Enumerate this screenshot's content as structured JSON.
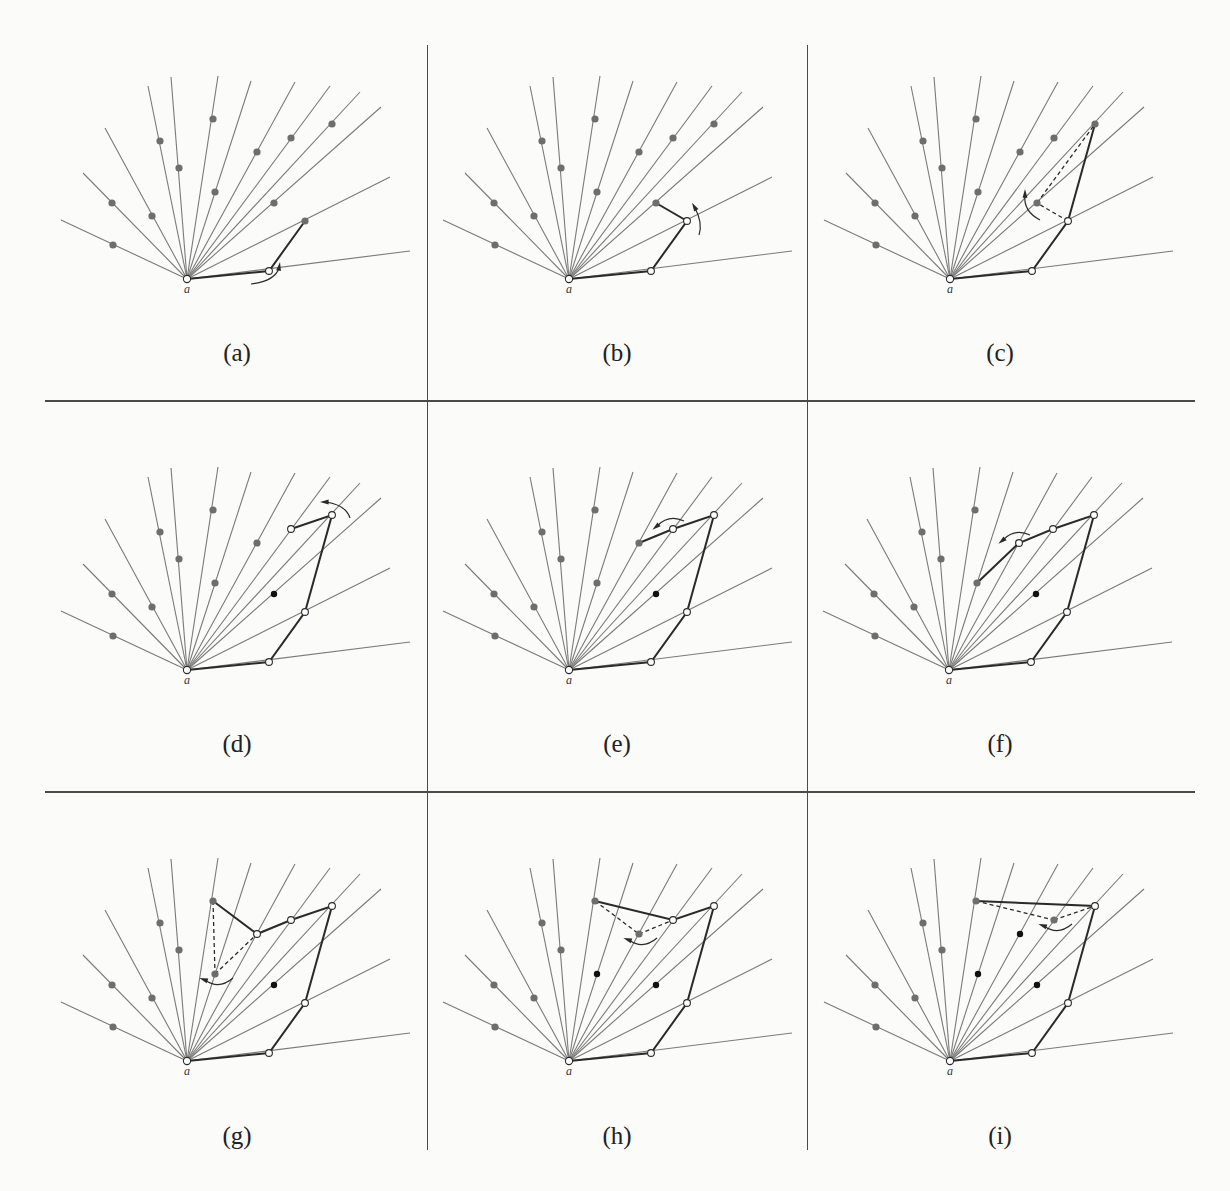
{
  "figure": {
    "origin_label": "a",
    "colors": {
      "ray": "#7a7a7a",
      "hull": "#2a2a2a",
      "point_gray": "#6e6e6e",
      "point_black": "#111111",
      "open_point_fill": "#ffffff",
      "divider": "#4a4a4a",
      "caption": "#222222"
    },
    "rays": [
      [
        -126,
        -59
      ],
      [
        -104,
        -106
      ],
      [
        -82,
        -151
      ],
      [
        -39,
        -193
      ],
      [
        -16,
        -202
      ],
      [
        31,
        -203
      ],
      [
        64,
        -198
      ],
      [
        108,
        -197
      ],
      [
        143,
        -193
      ],
      [
        173,
        -187
      ],
      [
        194,
        -172
      ],
      [
        203,
        -102
      ],
      [
        223,
        -28
      ]
    ],
    "points": {
      "r1": [
        -74,
        -34
      ],
      "r2": [
        -75,
        -76
      ],
      "r3": [
        -35,
        -63
      ],
      "r4": [
        -27,
        -138
      ],
      "r5": [
        -8,
        -111
      ],
      "r6": [
        26,
        -160
      ],
      "r7": [
        28,
        -87
      ],
      "r8": [
        70,
        -127
      ],
      "r9": [
        104,
        -141
      ],
      "r10": [
        145,
        -155
      ],
      "r11": [
        87,
        -76
      ],
      "r12": [
        118,
        -58
      ],
      "r13": [
        82,
        -8
      ]
    },
    "panels": [
      {
        "label": "(a)",
        "origin": [
          187,
          279
        ],
        "hull": [
          "a",
          "r13",
          "r12"
        ],
        "open": [
          "a",
          "r13"
        ],
        "black": [],
        "dashed": [],
        "arrow": {
          "at": [
            82,
            -8
          ],
          "dir": "ccw-below"
        }
      },
      {
        "label": "(b)",
        "origin": [
          569,
          279
        ],
        "hull": [
          "a",
          "r13",
          "r12",
          "r11"
        ],
        "open": [
          "a",
          "r13",
          "r12"
        ],
        "black": [],
        "dashed": [],
        "arrow": {
          "at": [
            118,
            -58
          ],
          "dir": "ccw-right"
        }
      },
      {
        "label": "(c)",
        "origin": [
          950,
          279
        ],
        "hull": [
          "a",
          "r13",
          "r12",
          "r10"
        ],
        "open": [
          "a",
          "r13",
          "r12"
        ],
        "black": [],
        "dashed": [
          [
            "r12",
            "r11"
          ],
          [
            "r11",
            "r10"
          ]
        ],
        "arrow": {
          "at": [
            87,
            -76
          ],
          "dir": "cw-left"
        }
      },
      {
        "label": "(d)",
        "origin": [
          187,
          670
        ],
        "hull": [
          "a",
          "r13",
          "r12",
          "r10",
          "r9"
        ],
        "open": [
          "a",
          "r13",
          "r12",
          "r10",
          "r9"
        ],
        "black": [
          "r11"
        ],
        "dashed": [],
        "arrow": {
          "at": [
            145,
            -155
          ],
          "dir": "ccw-top"
        }
      },
      {
        "label": "(e)",
        "origin": [
          569,
          670
        ],
        "hull": [
          "a",
          "r13",
          "r12",
          "r10",
          "r9",
          "r8"
        ],
        "open": [
          "a",
          "r13",
          "r12",
          "r10",
          "r9"
        ],
        "black": [
          "r11"
        ],
        "dashed": [],
        "arrow": {
          "at": [
            104,
            -141
          ],
          "dir": "ccw-top-left"
        }
      },
      {
        "label": "(f)",
        "origin": [
          949,
          670
        ],
        "hull": [
          "a",
          "r13",
          "r12",
          "r10",
          "r9",
          "r8",
          "r7"
        ],
        "open": [
          "a",
          "r13",
          "r12",
          "r10",
          "r9",
          "r8"
        ],
        "black": [
          "r11"
        ],
        "dashed": [],
        "arrow": {
          "at": [
            70,
            -127
          ],
          "dir": "ccw-top-left"
        }
      },
      {
        "label": "(g)",
        "origin": [
          187,
          1061
        ],
        "hull": [
          "a",
          "r13",
          "r12",
          "r10",
          "r9",
          "r8",
          "r6"
        ],
        "open": [
          "a",
          "r13",
          "r12",
          "r10",
          "r9",
          "r8"
        ],
        "black": [
          "r11"
        ],
        "dashed": [
          [
            "r6",
            "r7"
          ],
          [
            "r7",
            "r8"
          ]
        ],
        "arrow": {
          "at": [
            28,
            -87
          ],
          "dir": "cw-left-low"
        }
      },
      {
        "label": "(h)",
        "origin": [
          569,
          1061
        ],
        "hull": [
          "a",
          "r13",
          "r12",
          "r10",
          "r9",
          "r6"
        ],
        "open": [
          "a",
          "r13",
          "r12",
          "r10",
          "r9"
        ],
        "black": [
          "r11",
          "r7"
        ],
        "dashed": [
          [
            "r6",
            "r8"
          ],
          [
            "r8",
            "r9"
          ]
        ],
        "arrow": {
          "at": [
            70,
            -127
          ],
          "dir": "cw-left-low"
        }
      },
      {
        "label": "(i)",
        "origin": [
          950,
          1061
        ],
        "hull": [
          "a",
          "r13",
          "r12",
          "r10",
          "r6"
        ],
        "open": [
          "a",
          "r13",
          "r12",
          "r10"
        ],
        "black": [
          "r11",
          "r7",
          "r8"
        ],
        "dashed": [
          [
            "r6",
            "r9"
          ],
          [
            "r9",
            "r10"
          ]
        ],
        "arrow": {
          "at": [
            104,
            -141
          ],
          "dir": "cw-left-low"
        }
      }
    ],
    "captions_y": [
      354,
      745,
      1137
    ],
    "dividers": {
      "horizontal_y": [
        401,
        792
      ],
      "vertical_x": [
        427,
        807
      ]
    }
  }
}
